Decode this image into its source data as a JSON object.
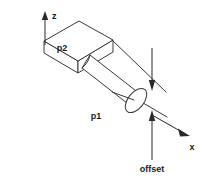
{
  "figure": {
    "background_color": "#ffffff",
    "line_color": "#3a3a3a",
    "text_color": "#1a1a1a",
    "labels": {
      "z_axis": "z",
      "x_axis": "x",
      "box": "p2",
      "cylinder": "p1",
      "offset": "offset"
    }
  },
  "diagram_data": {
    "type": "technical-line-drawing",
    "shapes": [
      {
        "name": "box",
        "label": "p2",
        "kind": "rectangular-prism",
        "top_face_points": "44,41 79,21 113,40 78,61",
        "front_left_face_points": "44,41 44,52 78,72 78,61",
        "front_right_face_points": "78,61 78,72 113,51 113,40"
      },
      {
        "name": "cylinder",
        "label": "p1",
        "kind": "cylinder",
        "axis_start": "88,76",
        "axis_end": "133,103",
        "radius_y": 14,
        "cap_cx": 132,
        "cap_cy": 103,
        "cap_rx": 8,
        "cap_ry": 14
      }
    ],
    "axes": [
      {
        "name": "z-axis",
        "label": "z",
        "direction": "up",
        "tail": "45,44",
        "head": "45,14",
        "label_pos": "52,16"
      },
      {
        "name": "x-axis",
        "label": "x",
        "direction": "down-right",
        "tail": "152,116",
        "head": "188,136",
        "label_pos": "190,148"
      }
    ],
    "dimension": {
      "name": "offset",
      "label": "offset",
      "upper_arrow": {
        "tail": "152,48",
        "head": "152,89",
        "direction": "down"
      },
      "lower_arrow": {
        "tail": "152,160",
        "head": "152,112",
        "direction": "up"
      },
      "label_pos": "152,172"
    },
    "reference_lines": [
      {
        "name": "upper-reference-line",
        "from": "113,40",
        "to": "165,91"
      },
      {
        "name": "lower-reference-line",
        "from": "92,72",
        "to": "165,115"
      }
    ]
  }
}
